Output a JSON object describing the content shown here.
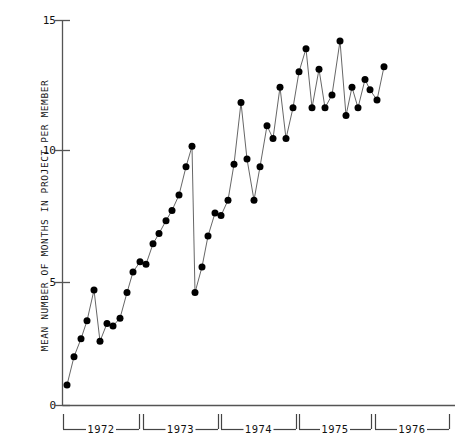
{
  "chart_data": {
    "type": "line",
    "title": "",
    "subtitle": "",
    "xlabel": "",
    "ylabel": "MEAN NUMBER OF MONTHS IN PROJECT PER MEMBER",
    "ylim": [
      0,
      15
    ],
    "yticks": [
      0,
      5,
      10,
      15
    ],
    "ytick_labels": [
      "0",
      "5",
      "10",
      "15"
    ],
    "grid": false,
    "legend": null,
    "markers": "filled-circle",
    "marker_color": "#000000",
    "line_color": "#555555",
    "axis_color": "#444444",
    "x_group_labels": [
      "1972",
      "1973",
      "1974",
      "1975",
      "1976"
    ],
    "x_group_spans": [
      {
        "label": "1972",
        "start_px": 63,
        "end_px": 139
      },
      {
        "label": "1973",
        "start_px": 143,
        "end_px": 218
      },
      {
        "label": "1974",
        "start_px": 221,
        "end_px": 296
      },
      {
        "label": "1975",
        "start_px": 299,
        "end_px": 371
      },
      {
        "label": "1976",
        "start_px": 375,
        "end_px": 449
      }
    ],
    "x": [
      1,
      2,
      3,
      4,
      5,
      6,
      7,
      8,
      9,
      10,
      11,
      12,
      13,
      14,
      15,
      16,
      17,
      18,
      19,
      20,
      21,
      22,
      23,
      24,
      25,
      26,
      27,
      28,
      29,
      30,
      31,
      32,
      33,
      34,
      35,
      36,
      37,
      38,
      39,
      40,
      41,
      42,
      43,
      44,
      45,
      46,
      47,
      48,
      49,
      50
    ],
    "values": [
      0.8,
      1.9,
      2.6,
      3.3,
      4.5,
      2.5,
      3.2,
      3.1,
      3.4,
      4.4,
      5.2,
      5.6,
      5.5,
      6.3,
      6.7,
      7.2,
      7.6,
      8.2,
      9.3,
      10.1,
      4.4,
      5.4,
      6.6,
      7.5,
      7.4,
      8.0,
      9.4,
      11.8,
      9.6,
      8.0,
      9.3,
      10.9,
      10.4,
      12.4,
      10.4,
      11.6,
      13.0,
      13.9,
      11.6,
      14.2,
      11.6,
      12.1,
      13.1,
      11.3,
      12.4,
      11.6,
      12.7,
      12.3,
      11.9,
      13.2
    ],
    "x_px": [
      67,
      74,
      81,
      87,
      94,
      100,
      107,
      113,
      120,
      127,
      133,
      140,
      146,
      153,
      159,
      166,
      172,
      179,
      186,
      192,
      195,
      202,
      208,
      215,
      221,
      228,
      234,
      241,
      247,
      254,
      260,
      267,
      273,
      280,
      286,
      293,
      299,
      306,
      312,
      340,
      325,
      332,
      319,
      346,
      352,
      358,
      365,
      370,
      377,
      384
    ]
  },
  "axis": {
    "y_top_label": "15",
    "y_mid_high_label": "10",
    "y_mid_low_label": "5",
    "y_zero_label": "0"
  }
}
